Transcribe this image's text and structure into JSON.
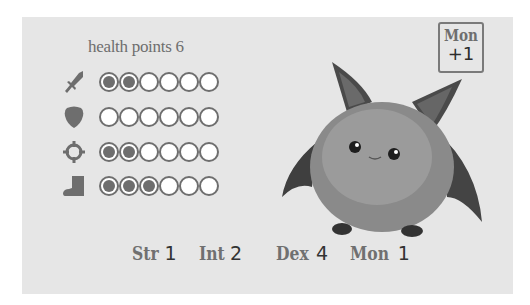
{
  "card": {
    "health": {
      "label": "health points",
      "value": "6"
    },
    "stats": [
      {
        "name": "attack",
        "icon": "sword-icon",
        "filled": 2,
        "total": 6
      },
      {
        "name": "defense",
        "icon": "shield-icon",
        "filled": 0,
        "total": 6
      },
      {
        "name": "aim",
        "icon": "crosshair-icon",
        "filled": 2,
        "total": 6
      },
      {
        "name": "speed",
        "icon": "boot-icon",
        "filled": 3,
        "total": 6
      }
    ],
    "badge": {
      "label": "Mon",
      "value": "+1"
    },
    "creature": {
      "name": "fluffy-bat-creature"
    },
    "attributes": [
      {
        "label": "Str",
        "value": "1"
      },
      {
        "label": "Int",
        "value": "2"
      },
      {
        "label": "Dex",
        "value": "4"
      },
      {
        "label": "Mon",
        "value": "1"
      }
    ],
    "colors": {
      "card_bg": "#e6e6e6",
      "ink": "#6e6e6e",
      "value_ink": "#333333"
    }
  }
}
